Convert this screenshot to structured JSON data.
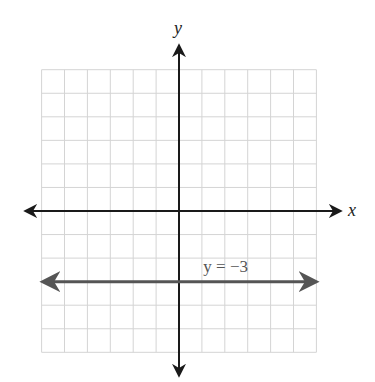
{
  "figure": {
    "partial_label": ")"
  },
  "chart_data": {
    "type": "line",
    "title": "",
    "xlabel": "x",
    "ylabel": "y",
    "xlim": [
      -6,
      6
    ],
    "ylim": [
      -6,
      6
    ],
    "grid": true,
    "grid_step": 1,
    "tick_labels_shown": false,
    "axes_arrows": true,
    "series": [
      {
        "name": "y = −3",
        "equation": "y = -3",
        "kind": "horizontal-line",
        "y": -3,
        "x_range": [
          -6,
          6
        ],
        "arrows": "both",
        "color": "#555555",
        "annotation": {
          "text": "y = −3",
          "x": 1.5,
          "y": -2.4
        }
      }
    ]
  },
  "colors": {
    "grid": "#d4d4d4",
    "axes": "#1a1a1a",
    "line": "#555555"
  },
  "layout": {
    "origin_px": [
      179,
      211
    ],
    "cell_w": 22.9,
    "cell_h": 23.55,
    "axis_x_from": 26,
    "axis_x_to": 340,
    "axis_y_from": 46,
    "axis_y_to": 375
  }
}
